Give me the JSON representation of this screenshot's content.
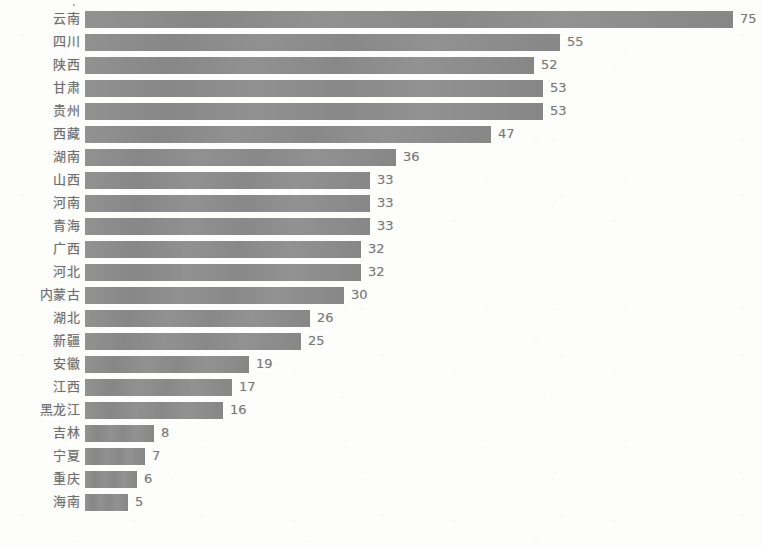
{
  "chart_data": {
    "type": "bar",
    "orientation": "horizontal",
    "title": "",
    "subtitle": "",
    "xlabel": "",
    "ylabel": "",
    "grid": false,
    "legend": null,
    "axis_visible": false,
    "tick_labels_visible": false,
    "value_labels_visible": true,
    "xlim": [
      0,
      75
    ],
    "bar_color": "#8b8b8b",
    "background_color": "#fdfdfc",
    "label_color": "#6f6f6f",
    "value_label_color": "#7a7a7a",
    "note": "Bottom rows are cropped by the image edge; the lowest visible bar is 海南 with value 5.",
    "categories": [
      "云南",
      "四川",
      "陕西",
      "甘肃",
      "贵州",
      "西藏",
      "湖南",
      "山西",
      "河南",
      "青海",
      "广西",
      "河北",
      "内蒙古",
      "湖北",
      "新疆",
      "安徽",
      "江西",
      "黑龙江",
      "吉林",
      "宁夏",
      "重庆",
      "海南"
    ],
    "values": [
      75,
      55,
      52,
      53,
      53,
      47,
      36,
      33,
      33,
      33,
      32,
      32,
      30,
      26,
      25,
      19,
      17,
      16,
      8,
      7,
      6,
      5
    ],
    "rows": [
      {
        "label": "云南",
        "value": 75,
        "value_text": "75"
      },
      {
        "label": "四川",
        "value": 55,
        "value_text": "55"
      },
      {
        "label": "陕西",
        "value": 52,
        "value_text": "52"
      },
      {
        "label": "甘肃",
        "value": 53,
        "value_text": "53"
      },
      {
        "label": "贵州",
        "value": 53,
        "value_text": "53"
      },
      {
        "label": "西藏",
        "value": 47,
        "value_text": "47"
      },
      {
        "label": "湖南",
        "value": 36,
        "value_text": "36"
      },
      {
        "label": "山西",
        "value": 33,
        "value_text": "33"
      },
      {
        "label": "河南",
        "value": 33,
        "value_text": "33"
      },
      {
        "label": "青海",
        "value": 33,
        "value_text": "33"
      },
      {
        "label": "广西",
        "value": 32,
        "value_text": "32"
      },
      {
        "label": "河北",
        "value": 32,
        "value_text": "32"
      },
      {
        "label": "内蒙古",
        "value": 30,
        "value_text": "30"
      },
      {
        "label": "湖北",
        "value": 26,
        "value_text": "26"
      },
      {
        "label": "新疆",
        "value": 25,
        "value_text": "25"
      },
      {
        "label": "安徽",
        "value": 19,
        "value_text": "19"
      },
      {
        "label": "江西",
        "value": 17,
        "value_text": "17"
      },
      {
        "label": "黑龙江",
        "value": 16,
        "value_text": "16"
      },
      {
        "label": "吉林",
        "value": 8,
        "value_text": "8"
      },
      {
        "label": "宁夏",
        "value": 7,
        "value_text": "7"
      },
      {
        "label": "重庆",
        "value": 6,
        "value_text": "6"
      },
      {
        "label": "海南",
        "value": 5,
        "value_text": "5"
      }
    ]
  },
  "layout": {
    "bar_origin_x": 85,
    "px_per_unit": 8.64,
    "row_pitch": 23,
    "first_row_top": 8,
    "bar_height": 17,
    "value_gap": 7
  }
}
